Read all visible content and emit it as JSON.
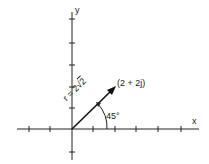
{
  "diagram": {
    "axes": {
      "x_label": "x",
      "y_label": "y"
    },
    "vector": {
      "point_label": "(2 + 2j)",
      "magnitude_prefix": "r = 2",
      "magnitude_radical_sign": "√",
      "magnitude_radicand": "2",
      "angle_label": "45°",
      "endpoint": [
        2,
        2
      ]
    },
    "colors": {
      "line": "#222222",
      "background": "#ffffff"
    }
  }
}
